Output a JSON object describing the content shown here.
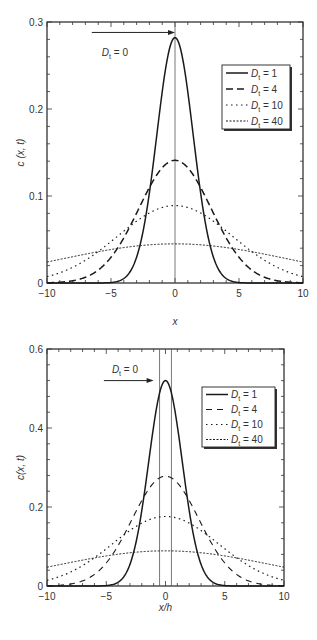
{
  "chart_data": [
    {
      "type": "line",
      "title": "",
      "xlabel": "x",
      "ylabel": "c (x, t)",
      "xlim": [
        -10,
        10
      ],
      "ylim": [
        0,
        0.3
      ],
      "xticks": [
        -10,
        -5,
        0,
        5,
        10
      ],
      "xtick_labels": [
        "−10",
        "−5",
        "0",
        "5",
        "10"
      ],
      "yticks": [
        0,
        0.1,
        0.2,
        0.3
      ],
      "ytick_labels": [
        "0",
        "0.1",
        "0.2",
        "0.3"
      ],
      "grid": false,
      "legend_position": "upper right",
      "annotation": {
        "text_main": "D",
        "text_sub": "t",
        "text_rest": " = 0",
        "arrow_from_x": -6.5,
        "arrow_to_x": 0,
        "arrow_y": 0.288
      },
      "source_lines_x": [
        0
      ],
      "series": [
        {
          "name": "Dt = 1",
          "D": 1,
          "peak": 0.282,
          "sigma": 1.414,
          "style": "solid"
        },
        {
          "name": "Dt = 4",
          "D": 4,
          "peak": 0.141,
          "sigma": 2.828,
          "style": "dashed"
        },
        {
          "name": "Dt = 10",
          "D": 10,
          "peak": 0.089,
          "sigma": 4.472,
          "style": "dotted"
        },
        {
          "name": "Dt = 40",
          "D": 40,
          "peak": 0.045,
          "sigma": 8.944,
          "style": "densedot"
        }
      ]
    },
    {
      "type": "line",
      "title": "",
      "xlabel": "x/h",
      "ylabel": "c(x, t)",
      "xlim": [
        -10,
        10
      ],
      "ylim": [
        0,
        0.6
      ],
      "xticks": [
        -10,
        -5,
        0,
        5,
        10
      ],
      "xtick_labels": [
        "−10",
        "−5",
        "0",
        "5",
        "10"
      ],
      "yticks": [
        0,
        0.2,
        0.4,
        0.6
      ],
      "ytick_labels": [
        "0",
        "0.2",
        "0.4",
        "0.6"
      ],
      "grid": false,
      "legend_position": "upper right",
      "annotation": {
        "text_main": "D",
        "text_sub": "t",
        "text_rest": " = 0",
        "arrow_from_x": -5.2,
        "arrow_to_x": -1.0,
        "arrow_y": 0.52
      },
      "source_lines_x": [
        -0.5,
        0.5
      ],
      "series": [
        {
          "name": "Dt = 1",
          "D": 1,
          "peak": 0.52,
          "sigma": 1.414,
          "style": "solid"
        },
        {
          "name": "Dt = 4",
          "D": 4,
          "peak": 0.278,
          "sigma": 2.828,
          "style": "longdash"
        },
        {
          "name": "Dt = 10",
          "D": 10,
          "peak": 0.176,
          "sigma": 4.472,
          "style": "dotted"
        },
        {
          "name": "Dt = 40",
          "D": 40,
          "peak": 0.089,
          "sigma": 8.944,
          "style": "densedot"
        }
      ]
    }
  ],
  "legend_labels": {
    "sub": "t",
    "main": "D",
    "values": [
      " = 1",
      " = 4",
      " = 10",
      " = 40"
    ]
  }
}
